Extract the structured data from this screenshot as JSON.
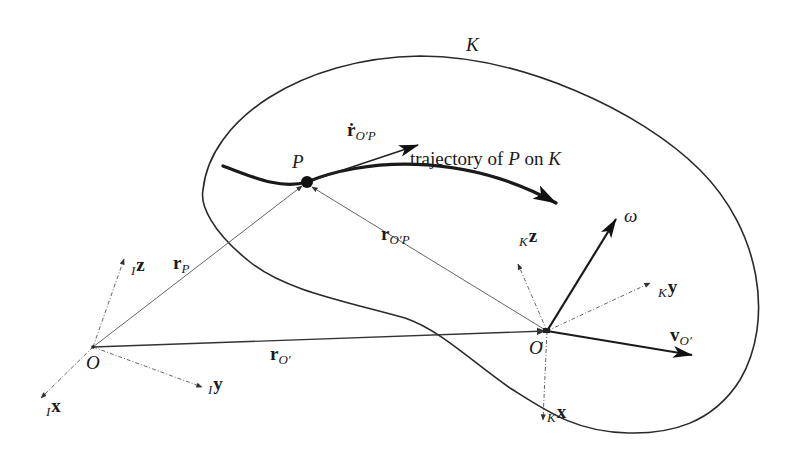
{
  "figure": {
    "type": "kinematics-diagram"
  },
  "body": {
    "label": "K"
  },
  "points": {
    "origin_inertial": "O",
    "origin_body": "O",
    "origin_body_prime": "′",
    "moving_point": "P"
  },
  "trajectory": {
    "label": "trajectory of ",
    "label_P": "P",
    "label_on": " on ",
    "label_K": "K"
  },
  "vectors": {
    "r_P": {
      "main": "r",
      "sub": "P"
    },
    "r_O_prime": {
      "main": "r",
      "sub": "O′"
    },
    "r_O_prime_P": {
      "main": "r",
      "sub": "O′P"
    },
    "r_dot_O_prime_P": {
      "main": "ṙ",
      "sub": "O′P"
    },
    "v_O_prime": {
      "main": "v",
      "sub": "O′"
    },
    "omega": {
      "main": "ω"
    }
  },
  "frames": {
    "inertial": {
      "prefix": "I",
      "axes": {
        "x": "x",
        "y": "y",
        "z": "z"
      }
    },
    "body": {
      "prefix": "K",
      "axes": {
        "x": "x",
        "y": "y",
        "z": "z"
      }
    }
  },
  "colors": {
    "ink": "#1a1a1a",
    "thin_line": "#555555",
    "background": "#ffffff"
  }
}
